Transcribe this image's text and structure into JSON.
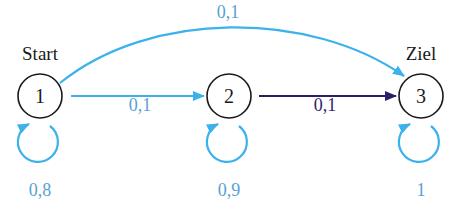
{
  "colors": {
    "light_edge": "#3cb2ec",
    "dark_edge": "#2f1e66",
    "light_label": "#5a9fd2",
    "dark_label": "#2f1e66",
    "node_stroke": "#1a1a1a"
  },
  "nodes": [
    {
      "id": "1",
      "label": "1",
      "name": "Start"
    },
    {
      "id": "2",
      "label": "2",
      "name": ""
    },
    {
      "id": "3",
      "label": "3",
      "name": "Ziel"
    }
  ],
  "edges": [
    {
      "from": "1",
      "to": "3",
      "label": "0,1",
      "style": "light",
      "shape": "arc"
    },
    {
      "from": "1",
      "to": "2",
      "label": "0,1",
      "style": "light",
      "shape": "straight"
    },
    {
      "from": "2",
      "to": "3",
      "label": "0,1",
      "style": "dark",
      "shape": "straight"
    },
    {
      "from": "1",
      "to": "1",
      "label": "0,8",
      "style": "light",
      "shape": "loop"
    },
    {
      "from": "2",
      "to": "2",
      "label": "0,9",
      "style": "light",
      "shape": "loop"
    },
    {
      "from": "3",
      "to": "3",
      "label": "1",
      "style": "light",
      "shape": "loop"
    }
  ]
}
